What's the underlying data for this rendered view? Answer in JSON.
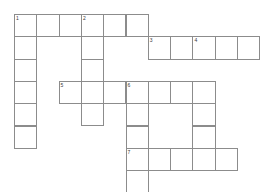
{
  "puzzle": {
    "type": "crossword-grid",
    "title": "Crossword Puzzle Grid",
    "cell_size": 22.3,
    "origin_x": 14,
    "origin_y": 14,
    "grid_colors": {
      "cell_fill": "#ffffff",
      "cell_border": "#8c8c8c",
      "number_text": "#3a3a3a",
      "page_background": "#ffffff"
    },
    "clue_numbers": [
      "1",
      "2",
      "3",
      "4",
      "5",
      "6",
      "7",
      "8"
    ],
    "entries": [
      {
        "number": "1",
        "direction": "across",
        "row": 0,
        "col": 0,
        "length": 6
      },
      {
        "number": "1",
        "direction": "down",
        "row": 0,
        "col": 0,
        "length": 6
      },
      {
        "number": "2",
        "direction": "down",
        "row": 0,
        "col": 3,
        "length": 5
      },
      {
        "number": "3",
        "direction": "across",
        "row": 1,
        "col": 6,
        "length": 5
      },
      {
        "number": "4",
        "direction": "down",
        "row": 1,
        "col": 8,
        "length": 5
      },
      {
        "number": "5",
        "direction": "across",
        "row": 3,
        "col": 2,
        "length": 6
      },
      {
        "number": "6",
        "direction": "down",
        "row": 3,
        "col": 5,
        "length": 6
      },
      {
        "number": "7",
        "direction": "across",
        "row": 6,
        "col": 5,
        "length": 6
      },
      {
        "number": "8",
        "direction": "across",
        "row": 8,
        "col": 0,
        "length": 6
      }
    ],
    "cells": [
      {
        "row": 0,
        "col": 0,
        "number": "1"
      },
      {
        "row": 0,
        "col": 1,
        "number": ""
      },
      {
        "row": 0,
        "col": 2,
        "number": ""
      },
      {
        "row": 0,
        "col": 3,
        "number": "2"
      },
      {
        "row": 0,
        "col": 4,
        "number": ""
      },
      {
        "row": 0,
        "col": 5,
        "number": ""
      },
      {
        "row": 1,
        "col": 0,
        "number": ""
      },
      {
        "row": 1,
        "col": 3,
        "number": ""
      },
      {
        "row": 1,
        "col": 6,
        "number": "3"
      },
      {
        "row": 1,
        "col": 7,
        "number": ""
      },
      {
        "row": 1,
        "col": 8,
        "number": "4"
      },
      {
        "row": 1,
        "col": 9,
        "number": ""
      },
      {
        "row": 1,
        "col": 10,
        "number": ""
      },
      {
        "row": 2,
        "col": 0,
        "number": ""
      },
      {
        "row": 2,
        "col": 3,
        "number": ""
      },
      {
        "row": 3,
        "col": 0,
        "number": ""
      },
      {
        "row": 3,
        "col": 2,
        "number": "5"
      },
      {
        "row": 3,
        "col": 3,
        "number": ""
      },
      {
        "row": 3,
        "col": 4,
        "number": ""
      },
      {
        "row": 3,
        "col": 5,
        "number": "6"
      },
      {
        "row": 3,
        "col": 6,
        "number": ""
      },
      {
        "row": 3,
        "col": 7,
        "number": ""
      },
      {
        "row": 3,
        "col": 8,
        "number": ""
      },
      {
        "row": 4,
        "col": 0,
        "number": ""
      },
      {
        "row": 4,
        "col": 3,
        "number": ""
      },
      {
        "row": 4,
        "col": 5,
        "number": ""
      },
      {
        "row": 4,
        "col": 8,
        "number": ""
      },
      {
        "row": 5,
        "col": 0,
        "number": ""
      },
      {
        "row": 5,
        "col": 5,
        "number": ""
      },
      {
        "row": 5,
        "col": 8,
        "number": ""
      },
      {
        "row": 6,
        "col": 5,
        "number": "7"
      },
      {
        "row": 6,
        "col": 6,
        "number": ""
      },
      {
        "row": 6,
        "col": 7,
        "number": ""
      },
      {
        "row": 6,
        "col": 8,
        "number": ""
      },
      {
        "row": 6,
        "col": 9,
        "number": ""
      },
      {
        "row": 7,
        "col": 5,
        "number": ""
      },
      {
        "row": 8,
        "col": 0,
        "number": "8"
      },
      {
        "row": 8,
        "col": 1,
        "number": ""
      },
      {
        "row": 8,
        "col": 2,
        "number": ""
      },
      {
        "row": 8,
        "col": 3,
        "number": ""
      },
      {
        "row": 8,
        "col": 4,
        "number": ""
      },
      {
        "row": 8,
        "col": 5,
        "number": ""
      }
    ]
  }
}
